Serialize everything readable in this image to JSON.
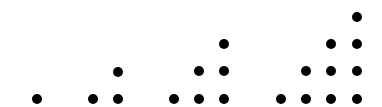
{
  "diagram": {
    "dot_color": "#000000",
    "dot_diameter": 10,
    "groups": [
      {
        "count": 1,
        "dots": [
          [
            37,
            99
          ]
        ]
      },
      {
        "count": 3,
        "dots": [
          [
            93,
            99
          ],
          [
            118,
            99
          ],
          [
            118,
            72
          ]
        ]
      },
      {
        "count": 6,
        "dots": [
          [
            174,
            99
          ],
          [
            199,
            99
          ],
          [
            224,
            99
          ],
          [
            199,
            71
          ],
          [
            224,
            71
          ],
          [
            224,
            44
          ]
        ]
      },
      {
        "count": 10,
        "dots": [
          [
            281,
            99
          ],
          [
            306,
            99
          ],
          [
            331,
            99
          ],
          [
            357,
            99
          ],
          [
            306,
            71
          ],
          [
            331,
            71
          ],
          [
            357,
            71
          ],
          [
            331,
            44
          ],
          [
            357,
            44
          ],
          [
            357,
            17
          ]
        ]
      }
    ]
  }
}
